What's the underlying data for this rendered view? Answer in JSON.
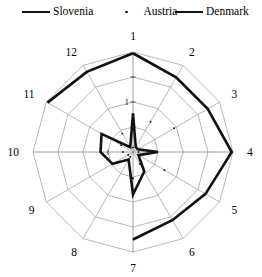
{
  "legend": {
    "items": [
      {
        "label": "Slovenia",
        "marker": "thick-line",
        "color": "#111111",
        "x": 22
      },
      {
        "label": "Austria",
        "marker": "dot",
        "color": "#111111",
        "x": 112
      },
      {
        "label": "Denmark",
        "marker": "thick-line",
        "color": "#111111",
        "x": 175
      }
    ]
  },
  "chart_data": {
    "type": "radar",
    "title": "",
    "categories": [
      "1",
      "2",
      "3",
      "4",
      "5",
      "6",
      "7",
      "8",
      "9",
      "10",
      "11",
      "12"
    ],
    "axis_tick_labels": [
      "0",
      "1"
    ],
    "rmax": 4,
    "rings": [
      1,
      2,
      3,
      4
    ],
    "grid": true,
    "legend_position": "top",
    "series": [
      {
        "name": "Denmark",
        "style": "thick-line",
        "color": "#111111",
        "values": [
          3.95,
          3.45,
          3.45,
          3.95,
          3.35,
          3.15,
          3.5,
          0.0,
          0.0,
          0.0,
          3.95,
          3.7
        ]
      },
      {
        "name": "Slovenia",
        "style": "thick-line",
        "color": "#111111",
        "values": [
          1.55,
          0.22,
          0.22,
          1.0,
          0.25,
          0.9,
          1.7,
          0.35,
          0.95,
          1.3,
          1.45,
          0.22
        ]
      },
      {
        "name": "Austria",
        "style": "dot-marker",
        "color": "#111111",
        "values": [
          0.18,
          1.4,
          1.9,
          0.22,
          1.45,
          0.55,
          1.05,
          0.22,
          0.22,
          0.4,
          0.55,
          0.85
        ]
      }
    ]
  },
  "geometry": {
    "cx": 133,
    "cy": 130,
    "r_outer": 100,
    "start_angle_deg": -90
  }
}
